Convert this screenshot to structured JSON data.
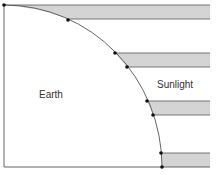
{
  "diagram": {
    "labels": {
      "earth": "Earth",
      "sunlight": "Sunlight"
    },
    "colors": {
      "band_fill": "#d4d4d4",
      "line": "#555555",
      "dot": "#111111",
      "background": "#ffffff"
    },
    "bands": [
      {
        "y_top": 5,
        "y_bottom": 19
      },
      {
        "y_top": 53,
        "y_bottom": 67
      },
      {
        "y_top": 101,
        "y_bottom": 115
      },
      {
        "y_top": 153,
        "y_bottom": 167
      }
    ]
  }
}
